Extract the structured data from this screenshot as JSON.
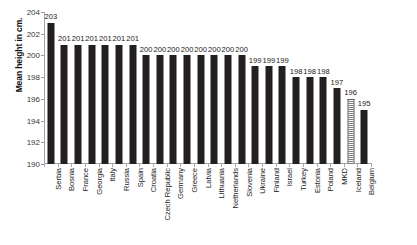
{
  "chart_data": {
    "type": "bar",
    "title": "",
    "xlabel": "",
    "ylabel": "Mean height in cm.",
    "ylim": [
      190,
      204
    ],
    "ytick_step": 2,
    "yticks": [
      190,
      192,
      194,
      196,
      198,
      200,
      202,
      204
    ],
    "grid": false,
    "legend": "none",
    "bar_color": "#231f20",
    "highlight_color": "#7d7d7d",
    "highlight_category": "Iceland",
    "highlight_style": "hatched",
    "categories": [
      "Serbia",
      "Bosnia",
      "France",
      "Georgia",
      "Italy",
      "Russia",
      "Spain",
      "Croatia",
      "Czech Republic",
      "Germany",
      "Greece",
      "Latvia",
      "Lithuania",
      "Netherlands",
      "Slovenia",
      "Ukraine",
      "Finland",
      "Israel",
      "Turkey",
      "Estonia",
      "Poland",
      "MKD",
      "Iceland",
      "Belgium"
    ],
    "values": [
      203,
      201,
      201,
      201,
      201,
      201,
      201,
      200,
      200,
      200,
      200,
      200,
      200,
      200,
      200,
      199,
      199,
      199,
      198,
      198,
      198,
      197,
      196,
      195
    ],
    "data_labels": [
      "203",
      "201",
      "201",
      "201",
      "201",
      "201",
      "201",
      "200",
      "200",
      "200",
      "200",
      "200",
      "200",
      "200",
      "200",
      "199",
      "199",
      "199",
      "198",
      "198",
      "198",
      "197",
      "196",
      "195"
    ]
  }
}
